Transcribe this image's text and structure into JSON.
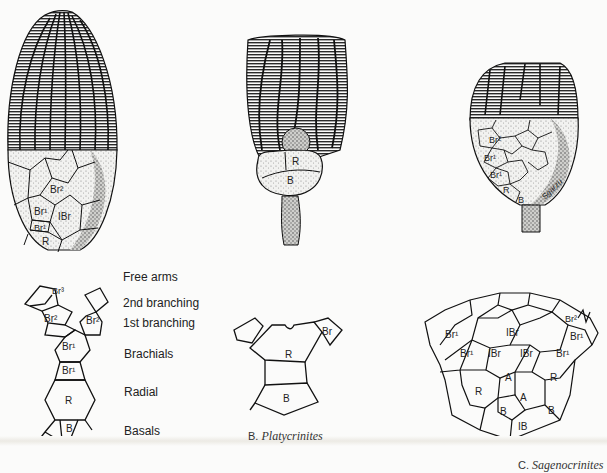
{
  "figure": {
    "panels": [
      {
        "id": "A",
        "specimen_labels": [
          "Br2",
          "Br1",
          "IBr",
          "Br1",
          "R"
        ],
        "diagram_plate_labels": [
          "Br3",
          "Br2",
          "Br2",
          "Br1",
          "Br1",
          "R",
          "B"
        ],
        "legend": [
          "Free arms",
          "2nd branching",
          "1st branching",
          "Brachials",
          "Radial",
          "Basals"
        ]
      },
      {
        "id": "B",
        "caption_letter": "B.",
        "caption_name": "Platycrinites",
        "specimen_labels": [
          "R",
          "B"
        ],
        "diagram_plate_labels": [
          "Br",
          "R",
          "B"
        ]
      },
      {
        "id": "C",
        "caption_letter": "C.",
        "caption_name": "Sagenocrinites",
        "specimen_labels": [
          "Br2",
          "Br1",
          "Br1",
          "R",
          "B"
        ],
        "signature": "Sgarzu",
        "diagram_plate_labels": [
          "Br2",
          "Br1",
          "IBr",
          "Br1",
          "Br1",
          "IBr",
          "IBr",
          "Br1",
          "A",
          "R",
          "R",
          "A",
          "B",
          "B",
          "IB"
        ]
      }
    ],
    "colors": {
      "ink": "#1a1a1a",
      "paper": "#fbfbfa",
      "stipple": "#9a9a9a"
    }
  }
}
